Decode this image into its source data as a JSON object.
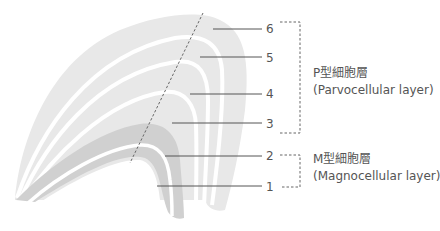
{
  "diagram": {
    "colors": {
      "parvo_layer": "#e6e6e6",
      "magno_layer": "#cfcfcf",
      "gap": "#ffffff",
      "leader_line": "#555555",
      "bracket": "#666666",
      "cut_line": "#666666",
      "text": "#555555"
    },
    "layers": [
      {
        "number": "1",
        "type": "magno"
      },
      {
        "number": "2",
        "type": "magno"
      },
      {
        "number": "3",
        "type": "parvo"
      },
      {
        "number": "4",
        "type": "parvo"
      },
      {
        "number": "5",
        "type": "parvo"
      },
      {
        "number": "6",
        "type": "parvo"
      }
    ],
    "groups": {
      "parvo": {
        "title": "P型細胞層",
        "subtitle": "(Parvocellular layer)"
      },
      "magno": {
        "title": "M型細胞層",
        "subtitle": "(Magnocellular layer)"
      }
    }
  }
}
